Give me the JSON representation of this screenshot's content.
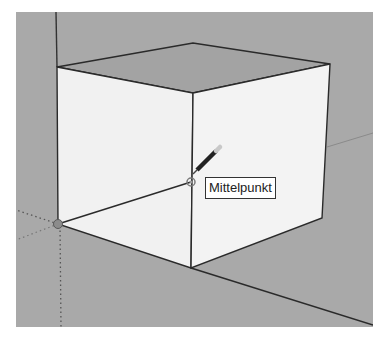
{
  "canvas": {
    "background": "#a9a9a9",
    "face_color": "#f1f1f1",
    "top_face_color": "#a3a3a3",
    "edge_color": "#2a2a2a"
  },
  "inference": {
    "tooltip_label": "Mittelpunkt",
    "tool": "pencil-line-tool"
  }
}
